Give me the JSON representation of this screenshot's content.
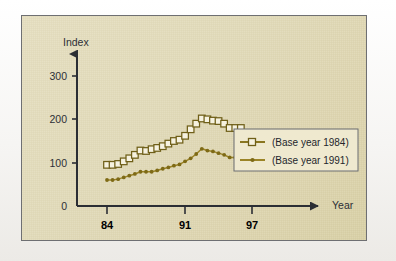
{
  "figure": {
    "panel_background": "#e2dbb9",
    "mat_background": "#f7f6f3",
    "frame_color": "#6e6f72"
  },
  "chart_data": {
    "type": "line",
    "title": "",
    "xlabel": "Year",
    "ylabel": "Index",
    "xlim": [
      83.0,
      98.2
    ],
    "ylim": [
      0,
      330
    ],
    "xticks": [
      84,
      91,
      97
    ],
    "xtick_labels": [
      "84",
      "91",
      "97"
    ],
    "yticks": [
      0,
      100,
      200,
      300
    ],
    "ytick_labels": [
      "0",
      "100",
      "200",
      "300"
    ],
    "grid": false,
    "legend_position": "right",
    "x": [
      84.0,
      84.5,
      85.0,
      85.5,
      86.0,
      86.5,
      87.0,
      87.5,
      88.0,
      88.5,
      89.0,
      89.5,
      90.0,
      90.5,
      91.0,
      91.5,
      92.0,
      92.5,
      93.0,
      93.5,
      94.0,
      94.5,
      95.0,
      95.5,
      96.0
    ],
    "series": [
      {
        "name": "(Base year 1984)",
        "color": "#8a7620",
        "marker": "square-open",
        "marker_fill": "#f6f2e0",
        "values": [
          95,
          95,
          97,
          103,
          110,
          118,
          128,
          127,
          131,
          134,
          138,
          144,
          150,
          153,
          162,
          177,
          190,
          202,
          200,
          197,
          196,
          190,
          180,
          180,
          180
        ]
      },
      {
        "name": "(Base year 1991)",
        "color": "#9b8426",
        "marker": "dot",
        "marker_fill": "#9b8426",
        "values": [
          60,
          60,
          62,
          66,
          70,
          74,
          79,
          79,
          79,
          82,
          86,
          89,
          93,
          96,
          103,
          110,
          120,
          132,
          128,
          126,
          122,
          118,
          112,
          112,
          112
        ]
      }
    ],
    "legend_entries": [
      {
        "label": "(Base year 1984)",
        "marker": "square-open",
        "color": "#8a7620"
      },
      {
        "label": "(Base year 1991)",
        "marker": "dot",
        "color": "#9b8426"
      }
    ]
  }
}
